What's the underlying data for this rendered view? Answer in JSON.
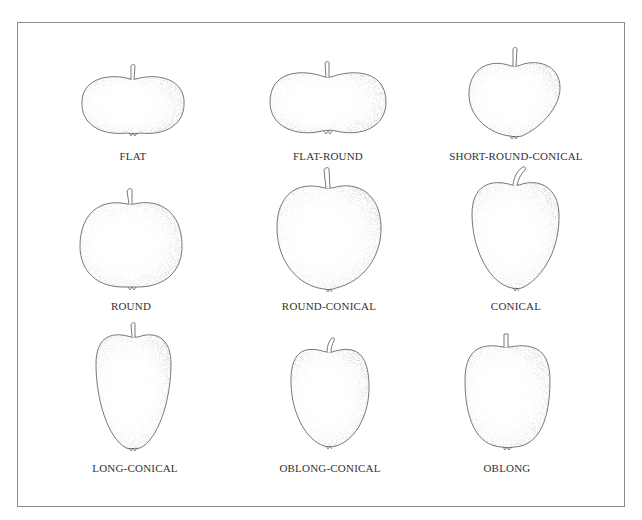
{
  "figure": {
    "frame_color": "#8a8a8a",
    "outline_color": "#555555",
    "stipple_color": "#7a7a7a",
    "shapes": [
      {
        "label": "FLAT",
        "cx": 133,
        "label_y": 150
      },
      {
        "label": "FLAT-ROUND",
        "cx": 328,
        "label_y": 150
      },
      {
        "label": "SHORT-ROUND-CONICAL",
        "cx": 516,
        "label_y": 150
      },
      {
        "label": "ROUND",
        "cx": 131,
        "label_y": 300
      },
      {
        "label": "ROUND-CONICAL",
        "cx": 329,
        "label_y": 300
      },
      {
        "label": "CONICAL",
        "cx": 516,
        "label_y": 300
      },
      {
        "label": "LONG-CONICAL",
        "cx": 135,
        "label_y": 462
      },
      {
        "label": "OBLONG-CONICAL",
        "cx": 330,
        "label_y": 462
      },
      {
        "label": "OBLONG",
        "cx": 507,
        "label_y": 462
      }
    ]
  }
}
